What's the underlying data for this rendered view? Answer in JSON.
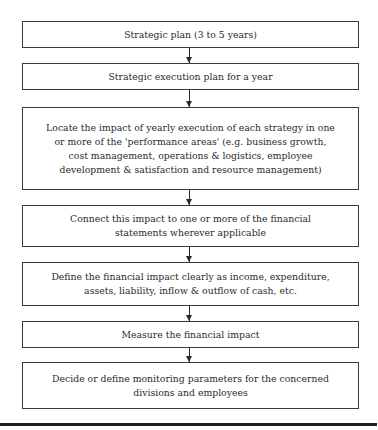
{
  "flowchart": {
    "steps": [
      {
        "text": "Strategic plan (3 to 5 years)"
      },
      {
        "text": "Strategic execution plan for a year"
      },
      {
        "text": "Locate the impact of yearly execution of each strategy in one or more of the 'performance areas' (e.g. business growth, cost management, operations & logistics, employee development & satisfaction and resource management)"
      },
      {
        "text": "Connect this impact to one or more of the financial statements wherever applicable"
      },
      {
        "text": "Define the financial impact clearly as income, expenditure, assets, liability, inflow & outflow of cash, etc."
      },
      {
        "text": "Measure the financial impact"
      },
      {
        "text": "Decide or define monitoring parameters for the concerned divisions and employees"
      }
    ],
    "connector": "down-arrow",
    "line_color": "#2a2a2a"
  }
}
